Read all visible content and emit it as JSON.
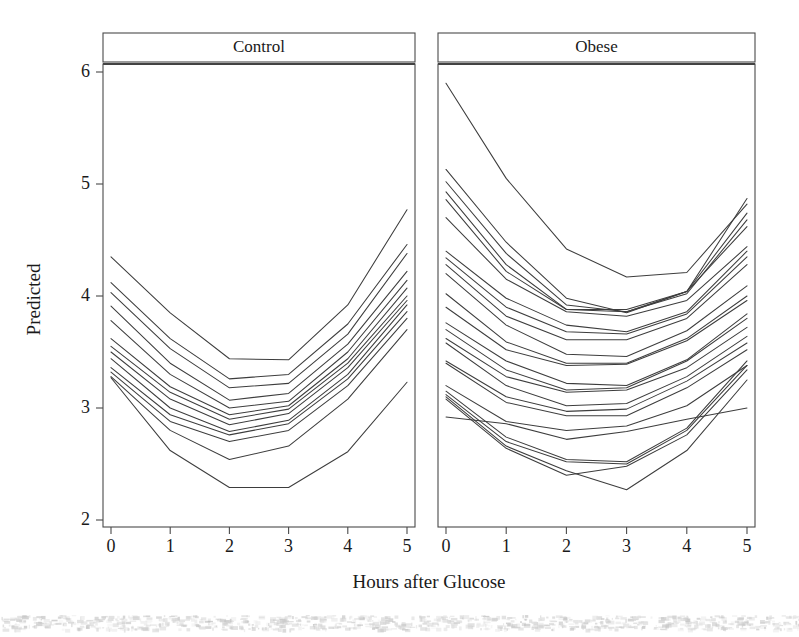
{
  "figure": {
    "xlabel": "Hours after Glucose",
    "ylabel": "Predicted",
    "background": "#ffffff",
    "line_color": "#3d3d3d",
    "frame_color": "#4a4a4a"
  },
  "chart_data": {
    "type": "line",
    "title": "",
    "subtitle": "",
    "xlabel": "Hours after Glucose",
    "ylabel": "Predicted",
    "xlim": [
      -0.35,
      5.35
    ],
    "ylim": [
      1.88,
      6.12
    ],
    "xticks": [
      0,
      1,
      2,
      3,
      4,
      5
    ],
    "xticklabels": [
      "0",
      "1",
      "2",
      "3",
      "4",
      "5"
    ],
    "yticks": [
      2,
      3,
      4,
      5,
      6
    ],
    "yticklabels": [
      "2",
      "3",
      "4",
      "5",
      "6"
    ],
    "grid": false,
    "legend": "none",
    "layout": "trellis, two panels side-by-side, shared y-axis",
    "panels": [
      {
        "label": "Control",
        "x": [
          0,
          1,
          2,
          3,
          4,
          5
        ],
        "series": [
          {
            "name": "c01",
            "values": [
              4.35,
              3.85,
              3.44,
              3.43,
              3.92,
              4.77
            ]
          },
          {
            "name": "c02",
            "values": [
              4.12,
              3.62,
              3.26,
              3.3,
              3.75,
              4.46
            ]
          },
          {
            "name": "c03",
            "values": [
              4.03,
              3.53,
              3.18,
              3.22,
              3.66,
              4.38
            ]
          },
          {
            "name": "c04",
            "values": [
              3.91,
              3.4,
              3.07,
              3.13,
              3.57,
              4.22
            ]
          },
          {
            "name": "c05",
            "values": [
              3.78,
              3.3,
              3.0,
              3.06,
              3.5,
              4.14
            ]
          },
          {
            "name": "c06",
            "values": [
              3.62,
              3.19,
              2.94,
              3.02,
              3.44,
              4.07
            ]
          },
          {
            "name": "c07",
            "values": [
              3.55,
              3.14,
              2.9,
              2.99,
              3.4,
              4.0
            ]
          },
          {
            "name": "c08",
            "values": [
              3.5,
              3.08,
              2.85,
              2.95,
              3.36,
              3.96
            ]
          },
          {
            "name": "c09",
            "values": [
              3.44,
              3.0,
              2.79,
              2.89,
              3.3,
              3.92
            ]
          },
          {
            "name": "c10",
            "values": [
              3.36,
              2.94,
              2.76,
              2.86,
              3.26,
              3.86
            ]
          },
          {
            "name": "c11",
            "values": [
              3.32,
              2.88,
              2.7,
              2.8,
              3.2,
              3.8
            ]
          },
          {
            "name": "c12",
            "values": [
              3.28,
              2.8,
              2.54,
              2.66,
              3.08,
              3.7
            ]
          },
          {
            "name": "c13",
            "values": [
              3.27,
              2.62,
              2.29,
              2.29,
              2.61,
              3.23
            ]
          }
        ]
      },
      {
        "label": "Obese",
        "x": [
          0,
          1,
          2,
          3,
          4,
          5
        ],
        "series": [
          {
            "name": "o01",
            "values": [
              5.9,
              5.05,
              4.42,
              4.17,
              4.21,
              4.82
            ]
          },
          {
            "name": "o02",
            "values": [
              5.13,
              4.48,
              3.98,
              3.85,
              4.04,
              4.87
            ]
          },
          {
            "name": "o03",
            "values": [
              5.02,
              4.38,
              3.92,
              3.86,
              4.04,
              4.74
            ]
          },
          {
            "name": "o04",
            "values": [
              4.93,
              4.28,
              3.88,
              3.86,
              4.02,
              4.68
            ]
          },
          {
            "name": "o05",
            "values": [
              4.86,
              4.22,
              3.88,
              3.88,
              4.04,
              4.62
            ]
          },
          {
            "name": "o06",
            "values": [
              4.7,
              4.15,
              3.86,
              3.82,
              3.96,
              4.44
            ]
          },
          {
            "name": "o07",
            "values": [
              4.4,
              3.98,
              3.74,
              3.68,
              3.86,
              4.4
            ]
          },
          {
            "name": "o08",
            "values": [
              4.34,
              3.9,
              3.68,
              3.66,
              3.84,
              4.35
            ]
          },
          {
            "name": "o09",
            "values": [
              4.28,
              3.82,
              3.61,
              3.61,
              3.8,
              4.28
            ]
          },
          {
            "name": "o10",
            "values": [
              4.2,
              3.74,
              3.48,
              3.46,
              3.69,
              4.09
            ]
          },
          {
            "name": "o11",
            "values": [
              4.02,
              3.59,
              3.4,
              3.4,
              3.62,
              4.0
            ]
          },
          {
            "name": "o12",
            "values": [
              3.9,
              3.52,
              3.38,
              3.39,
              3.6,
              3.96
            ]
          },
          {
            "name": "o13",
            "values": [
              3.76,
              3.42,
              3.22,
              3.2,
              3.43,
              3.84
            ]
          },
          {
            "name": "o14",
            "values": [
              3.7,
              3.34,
              3.16,
              3.18,
              3.42,
              3.8
            ]
          },
          {
            "name": "o15",
            "values": [
              3.62,
              3.28,
              3.14,
              3.16,
              3.36,
              3.72
            ]
          },
          {
            "name": "o16",
            "values": [
              3.58,
              3.2,
              3.02,
              3.04,
              3.28,
              3.64
            ]
          },
          {
            "name": "o17",
            "values": [
              3.42,
              3.1,
              2.97,
              2.99,
              3.24,
              3.58
            ]
          },
          {
            "name": "o18",
            "values": [
              3.4,
              3.05,
              2.93,
              2.93,
              3.18,
              3.52
            ]
          },
          {
            "name": "o19",
            "values": [
              3.2,
              2.88,
              2.8,
              2.84,
              3.02,
              3.38
            ]
          },
          {
            "name": "o20",
            "values": [
              3.15,
              2.74,
              2.54,
              2.52,
              2.82,
              3.42
            ]
          },
          {
            "name": "o21",
            "values": [
              3.12,
              2.7,
              2.52,
              2.5,
              2.8,
              3.38
            ]
          },
          {
            "name": "o22",
            "values": [
              3.1,
              2.66,
              2.44,
              2.27,
              2.62,
              3.25
            ]
          },
          {
            "name": "o23",
            "values": [
              3.08,
              2.64,
              2.4,
              2.48,
              2.76,
              3.34
            ]
          },
          {
            "name": "o24",
            "values": [
              2.92,
              2.86,
              2.72,
              2.79,
              2.9,
              3.0
            ]
          }
        ]
      }
    ]
  }
}
